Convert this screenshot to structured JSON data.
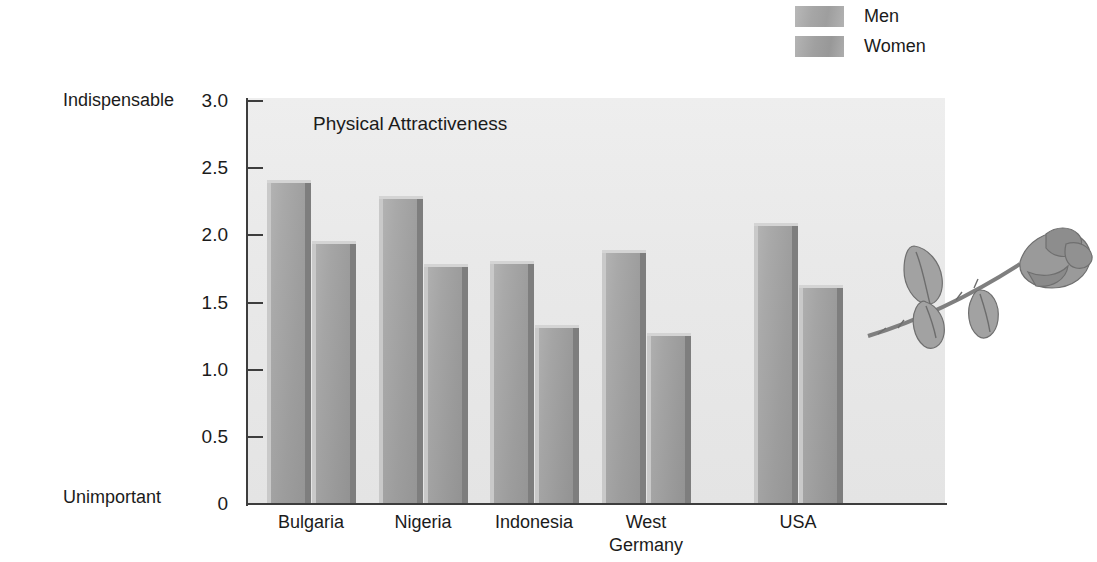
{
  "chart_data": {
    "type": "bar",
    "title": "Physical Attractiveness",
    "xlabel": "",
    "ylabel": "",
    "categories": [
      "Bulgaria",
      "Nigeria",
      "Indonesia",
      "West\nGermany",
      "USA"
    ],
    "series": [
      {
        "name": "Men",
        "values": [
          2.41,
          2.29,
          1.81,
          1.89,
          2.09
        ],
        "color": "#a4a4a4"
      },
      {
        "name": "Women",
        "values": [
          1.96,
          1.79,
          1.33,
          1.27,
          1.63
        ],
        "color": "#a0a0a0"
      }
    ],
    "ylim": [
      0,
      3.0
    ],
    "yticks": [
      "3.0",
      "2.5",
      "2.0",
      "1.5",
      "1.0",
      "0.5",
      "0"
    ],
    "ytick_values": [
      3.0,
      2.5,
      2.0,
      1.5,
      1.0,
      0.5,
      0
    ],
    "y_axis_top_label": "Indispensable",
    "y_axis_bottom_label": "Unimportant",
    "grid": false,
    "legend_position": "top-right",
    "plot_background": "#e9e9e9",
    "axis_color": "#3d3d3d"
  },
  "legend": {
    "items": [
      {
        "label": "Men",
        "swatch": "men-swatch"
      },
      {
        "label": "Women",
        "swatch": "women-swatch"
      }
    ]
  },
  "decoration": {
    "name": "rose-illustration"
  }
}
